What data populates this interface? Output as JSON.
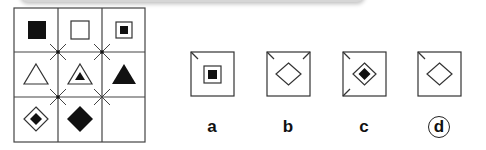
{
  "puzzle": {
    "grid": {
      "rows": 3,
      "cols": 3,
      "cells": [
        [
          "black-square",
          "white-square",
          "square-in-square-with-black-center"
        ],
        [
          "white-triangle",
          "triangle-in-triangle-with-black-center",
          "black-triangle"
        ],
        [
          "diamond-in-diamond-with-black-center",
          "black-diamond",
          "empty"
        ]
      ],
      "intersection_marks": "x-cross"
    },
    "options": [
      {
        "label": "a",
        "shape": "square-in-square-with-black-center",
        "corner_ticks": [
          "top-left"
        ],
        "selected": false
      },
      {
        "label": "b",
        "shape": "white-diamond",
        "corner_ticks": [
          "top-left",
          "top-right"
        ],
        "selected": false
      },
      {
        "label": "c",
        "shape": "diamond-in-diamond-with-black-center",
        "corner_ticks": [
          "top-left",
          "bottom-left"
        ],
        "selected": false
      },
      {
        "label": "d",
        "shape": "white-diamond",
        "corner_ticks": [
          "top-left"
        ],
        "selected": true
      }
    ]
  },
  "colors": {
    "stroke": "#333333",
    "fill": "#111111",
    "background": "#ffffff"
  }
}
